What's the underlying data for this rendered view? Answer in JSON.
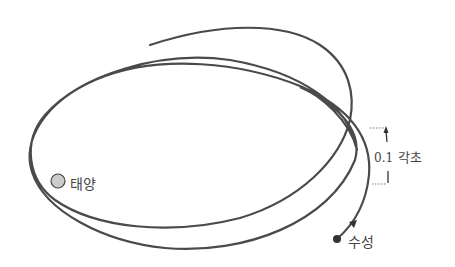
{
  "diagram": {
    "sun": {
      "label": "태양",
      "fill": "#cccccc",
      "stroke": "#444444"
    },
    "planet": {
      "label": "수성",
      "fill": "#333333"
    },
    "precession": {
      "value": "0.1",
      "unit": "각초"
    },
    "colors": {
      "orbit": "#4a4a4a",
      "text": "#444444",
      "dotted": "#777777"
    }
  }
}
